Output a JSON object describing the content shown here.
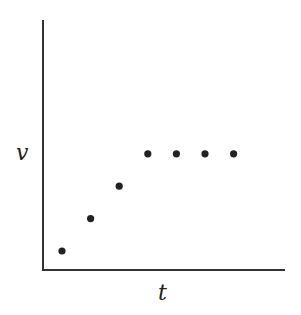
{
  "chart_data": {
    "type": "scatter",
    "title": "",
    "xlabel": "t",
    "ylabel": "v",
    "grid": false,
    "legend": null,
    "x": [
      1,
      2,
      3,
      4,
      5,
      6,
      7
    ],
    "values": [
      1,
      2,
      3,
      4,
      4,
      4,
      4
    ],
    "xlim": [
      0,
      8.4
    ],
    "ylim": [
      0,
      6.2
    ],
    "point_color": "#222222",
    "axis_color": "#333333"
  }
}
